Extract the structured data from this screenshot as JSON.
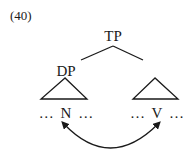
{
  "example_number": "(40)",
  "tree": {
    "root": {
      "label": "TP"
    },
    "left_child": {
      "label": "DP",
      "terminal": {
        "left_dots": "…",
        "head": "N",
        "right_dots": "…"
      }
    },
    "right_child": {
      "label": "",
      "terminal": {
        "left_dots": "…",
        "head": "V",
        "right_dots": "…"
      }
    }
  },
  "relation": {
    "type": "double-headed-arrow",
    "from": "N",
    "to": "V"
  }
}
